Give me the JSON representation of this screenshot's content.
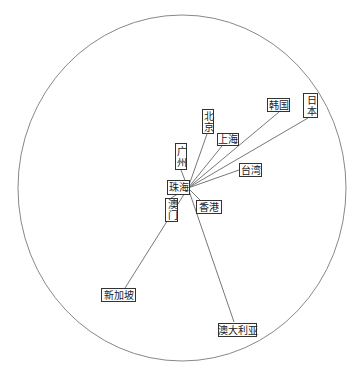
{
  "diagram": {
    "type": "hub-and-spoke",
    "hub": {
      "label": "珠海",
      "x": 188,
      "y": 188
    },
    "boundary": {
      "cx": 182,
      "cy": 188,
      "rx": 164,
      "ry": 173,
      "stroke": "#888888"
    },
    "line_color": "#777777",
    "nodes": [
      {
        "id": "beijing",
        "label": "北京",
        "vertical": true,
        "box": [
          202,
          109,
          12,
          25
        ],
        "end": [
          207,
          134
        ]
      },
      {
        "id": "guangzhou",
        "label": "广州",
        "vertical": true,
        "box": [
          175,
          143,
          12,
          27
        ],
        "end": [
          181,
          170
        ]
      },
      {
        "id": "shanghai",
        "label": "上海",
        "vertical": false,
        "box": [
          217,
          133,
          22,
          13
        ],
        "end": [
          222,
          146
        ]
      },
      {
        "id": "korea",
        "label": "韩国",
        "vertical": false,
        "box": [
          267,
          98,
          23,
          14
        ],
        "end": [
          279,
          112
        ]
      },
      {
        "id": "japan",
        "label": "日本",
        "vertical": true,
        "box": [
          303,
          93,
          15,
          25
        ],
        "end": [
          308,
          118
        ]
      },
      {
        "id": "taiwan",
        "label": "台湾",
        "vertical": false,
        "box": [
          239,
          163,
          23,
          14
        ],
        "end": [
          239,
          170
        ]
      },
      {
        "id": "hongkong",
        "label": "香港",
        "vertical": false,
        "box": [
          196,
          200,
          26,
          14
        ],
        "end": [
          200,
          200
        ]
      },
      {
        "id": "macau",
        "label": "澳门",
        "vertical": true,
        "box": [
          165,
          198,
          13,
          24
        ],
        "end": [
          171,
          198
        ]
      },
      {
        "id": "singapore",
        "label": "新加坡",
        "vertical": false,
        "box": [
          101,
          288,
          35,
          14
        ],
        "end": [
          125,
          288
        ]
      },
      {
        "id": "australia",
        "label": "澳大利亚",
        "vertical": false,
        "box": [
          218,
          323,
          39,
          14
        ],
        "end": [
          234,
          322
        ]
      }
    ]
  }
}
